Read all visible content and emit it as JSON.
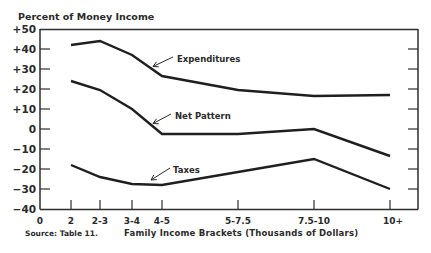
{
  "chart_data": {
    "type": "line",
    "title": "",
    "ylabel": "Percent of Money Income",
    "xlabel": "Family Income Brackets (Thousands of Dollars)",
    "source": "Source: Table 11.",
    "categories": [
      "2",
      "2-3",
      "3-4",
      "4-5",
      "5-7.5",
      "7.5-10",
      "10+"
    ],
    "x_origin_label": "0",
    "ylim": [
      -40,
      50
    ],
    "yticks": [
      50,
      40,
      30,
      20,
      10,
      0,
      -10,
      -20,
      -30,
      -40
    ],
    "ytick_labels": [
      "+50",
      "+40",
      "+30",
      "+20",
      "+10",
      "0",
      "−10",
      "−20",
      "−30",
      "−40"
    ],
    "grid": false,
    "legend": "inline labels with arrows",
    "series": [
      {
        "name": "Expenditures",
        "values": [
          42,
          44,
          37,
          26.5,
          19.5,
          16.5,
          17
        ]
      },
      {
        "name": "Net Pattern",
        "values": [
          24,
          19.5,
          10,
          -2.5,
          -2.5,
          0,
          -13.5
        ]
      },
      {
        "name": "Taxes",
        "values": [
          -18,
          -24,
          -27.5,
          -28,
          -21.5,
          -15,
          -30
        ]
      }
    ]
  },
  "labels": {
    "y_title": "Percent of Money Income",
    "x_title": "Family Income Brackets (Thousands of Dollars)",
    "source": "Source: Table 11.",
    "x_zero": "0",
    "series_expenditures": "Expenditures",
    "series_net": "Net Pattern",
    "series_taxes": "Taxes"
  }
}
